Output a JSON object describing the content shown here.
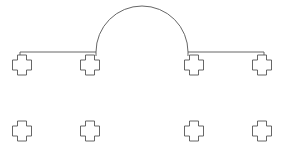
{
  "diagram": {
    "background": "#ffffff",
    "stroke_color": "#555555",
    "stroke_width": 0.9,
    "arc": {
      "cx": 142,
      "cy": 52,
      "r": 46
    },
    "connector_lines": [
      {
        "x1": 20,
        "y1": 52,
        "x2": 96,
        "y2": 52
      },
      {
        "x1": 188,
        "y1": 52,
        "x2": 264,
        "y2": 52
      }
    ],
    "ticks": [
      {
        "x": 20,
        "y1": 52,
        "y2": 56
      },
      {
        "x": 96,
        "y1": 52,
        "y2": 56
      },
      {
        "x": 188,
        "y1": 52,
        "y2": 56
      },
      {
        "x": 264,
        "y1": 52,
        "y2": 56
      }
    ],
    "nodes": [
      {
        "id": "node-top-1",
        "cx": 22,
        "cy": 65
      },
      {
        "id": "node-top-2",
        "cx": 90,
        "cy": 65
      },
      {
        "id": "node-top-3",
        "cx": 194,
        "cy": 65
      },
      {
        "id": "node-top-4",
        "cx": 262,
        "cy": 65
      },
      {
        "id": "node-bottom-1",
        "cx": 22,
        "cy": 131
      },
      {
        "id": "node-bottom-2",
        "cx": 90,
        "cy": 131
      },
      {
        "id": "node-bottom-3",
        "cx": 194,
        "cy": 131
      },
      {
        "id": "node-bottom-4",
        "cx": 262,
        "cy": 131
      }
    ],
    "node_size": {
      "w": 19,
      "h": 20,
      "notch": 5
    }
  }
}
